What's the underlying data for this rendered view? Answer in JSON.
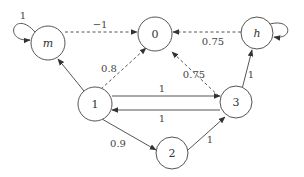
{
  "diagram": {
    "type": "state-transition-graph",
    "nodes": [
      {
        "id": "m",
        "label": "m",
        "italic": true
      },
      {
        "id": "0",
        "label": "0",
        "italic": false
      },
      {
        "id": "h",
        "label": "h",
        "italic": true
      },
      {
        "id": "1",
        "label": "1",
        "italic": false
      },
      {
        "id": "3",
        "label": "3",
        "italic": false
      },
      {
        "id": "2",
        "label": "2",
        "italic": false
      }
    ],
    "edges": [
      {
        "from": "m",
        "to": "m",
        "label": "1",
        "style": "solid"
      },
      {
        "from": "m",
        "to": "0",
        "label": "−1",
        "style": "dashed"
      },
      {
        "from": "h",
        "to": "0",
        "label": "0.75",
        "style": "dashed"
      },
      {
        "from": "h",
        "to": "h",
        "label": "0.75",
        "style": "solid"
      },
      {
        "from": "1",
        "to": "m",
        "label": "",
        "style": "solid"
      },
      {
        "from": "1",
        "to": "0",
        "label": "0.8",
        "style": "dashed"
      },
      {
        "from": "3",
        "to": "0",
        "label": "0.75",
        "style": "dashed"
      },
      {
        "from": "3",
        "to": "h",
        "label": "1",
        "style": "solid"
      },
      {
        "from": "1",
        "to": "3",
        "label": "1",
        "style": "solid"
      },
      {
        "from": "3",
        "to": "1",
        "label": "1",
        "style": "solid"
      },
      {
        "from": "1",
        "to": "2",
        "label": "0.9",
        "style": "solid"
      },
      {
        "from": "2",
        "to": "3",
        "label": "1",
        "style": "solid"
      }
    ]
  }
}
